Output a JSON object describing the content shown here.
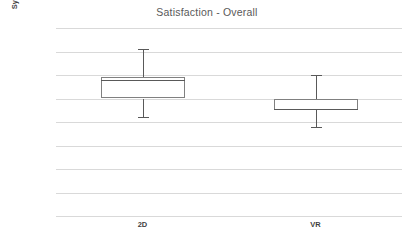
{
  "chart_data": {
    "type": "box",
    "title": "Satisfaction - Overall",
    "xlabel": "",
    "ylabel": "System USability Scale",
    "ylim": [
      0,
      80
    ],
    "ytick_step": 10,
    "decimal_separator": ",",
    "grid": true,
    "legend": "none",
    "categories": [
      "2D",
      "VR"
    ],
    "ytick_labels": [
      "0,0",
      "10,0",
      "20,0",
      "30,0",
      "40,0",
      "50,0",
      "60,0",
      "70,0",
      "80,0"
    ],
    "ytick_values": [
      0,
      10,
      20,
      30,
      40,
      50,
      60,
      70,
      80
    ],
    "series": [
      {
        "name": "2D",
        "min": 42.0,
        "q1": 50.0,
        "median": 58.0,
        "q3": 59.0,
        "max": 71.0
      },
      {
        "name": "VR",
        "min": 38.0,
        "q1": 45.0,
        "median": 45.5,
        "q3": 50.0,
        "max": 60.0
      }
    ]
  },
  "colors": {
    "title_text": "#595959",
    "axis_text": "#595959",
    "axis_title_text": "#3f3f3f",
    "gridline": "#d9d9d9",
    "box_outline": "#808080",
    "box_fill": "#ffffff",
    "whisker": "#595959",
    "plot_background": "#ffffff"
  }
}
